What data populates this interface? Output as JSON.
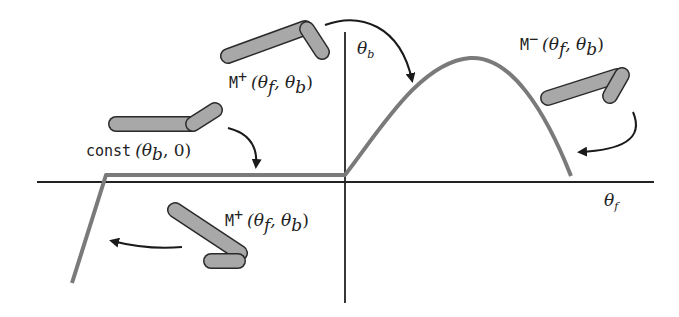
{
  "figure": {
    "axes": {
      "x_label": "θ",
      "x_sub": "f",
      "y_label": "θ",
      "y_sub": "b"
    },
    "labels": {
      "m_plus_top": {
        "name": "M",
        "sup": "+",
        "args": "(θ",
        "a_sub": "f",
        "mid": ", θ",
        "b_sub": "b",
        "close": ")"
      },
      "const": {
        "name": "const",
        "args": "(θ",
        "a_sub": "b",
        "mid": ", 0",
        "close": ")"
      },
      "m_minus": {
        "name": "M",
        "sup": "−",
        "args": "(θ",
        "a_sub": "f",
        "mid": ", θ",
        "b_sub": "b",
        "close": ")"
      },
      "m_plus_bottom": {
        "name": "M",
        "sup": "+",
        "args": "(θ",
        "a_sub": "f",
        "mid": ", θ",
        "b_sub": "b",
        "close": ")"
      }
    },
    "colors": {
      "axis": "#222222",
      "curve": "#7a7a7a",
      "limb_fill": "#a8a8a8",
      "limb_stroke": "#2a2a2a",
      "arrow": "#1a1a1a"
    }
  }
}
